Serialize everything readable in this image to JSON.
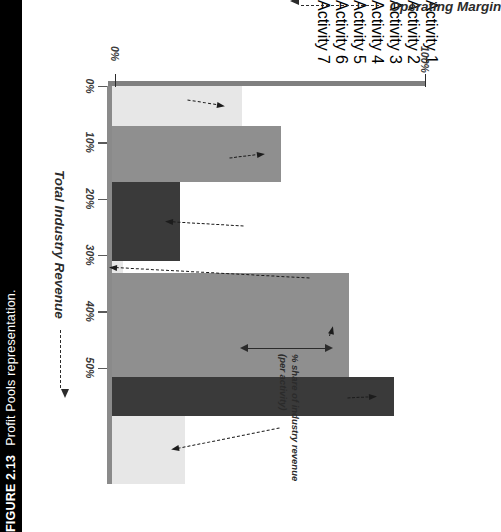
{
  "figure": {
    "number": "FIGURE 2.13",
    "caption": "Profit Pools representation."
  },
  "chart_data": {
    "type": "bar",
    "title": "Profit Pools representation.",
    "xlabel": "Total Industry Revenue",
    "ylabel": "Operating Margin",
    "xlim": [
      0,
      100
    ],
    "ylim": [
      0,
      55
    ],
    "grid": false,
    "orientation": "marimekko-profit-pool",
    "xtick_labels": [
      "0%",
      "100%"
    ],
    "ytick_labels": [
      "0%",
      "10%",
      "20%",
      "30%",
      "40%",
      "50%"
    ],
    "ytick_values": [
      0,
      10,
      20,
      30,
      40,
      50
    ],
    "categories": [
      "Activity 1",
      "Activity 2",
      "Activity 3",
      "Activity 4",
      "Activity 5",
      "Activity 6",
      "Activity 7"
    ],
    "series": [
      {
        "name": "Operating Margin",
        "values": [
          23,
          30,
          12,
          2,
          42,
          50,
          13
        ]
      },
      {
        "name": "% share of industry revenue",
        "values": [
          10,
          14,
          20,
          3,
          26,
          10,
          17
        ]
      }
    ],
    "segments": [
      {
        "label": "Activity 1",
        "margin": 23,
        "revenue_share": 10,
        "revenue_start": 0,
        "revenue_end": 10,
        "fill": "#e7e7e7"
      },
      {
        "label": "Activity 2",
        "margin": 30,
        "revenue_share": 14,
        "revenue_start": 10,
        "revenue_end": 24,
        "fill": "#8f8f8f"
      },
      {
        "label": "Activity 3",
        "margin": 12,
        "revenue_share": 20,
        "revenue_start": 24,
        "revenue_end": 44,
        "fill": "#3a3a3a"
      },
      {
        "label": "Activity 4",
        "margin": 2,
        "revenue_share": 3,
        "revenue_start": 44,
        "revenue_end": 47,
        "fill": "#e7e7e7"
      },
      {
        "label": "Activity 5",
        "margin": 42,
        "revenue_share": 26,
        "revenue_start": 47,
        "revenue_end": 73,
        "fill": "#8f8f8f"
      },
      {
        "label": "Activity 6",
        "margin": 50,
        "revenue_share": 10,
        "revenue_start": 73,
        "revenue_end": 83,
        "fill": "#3a3a3a"
      },
      {
        "label": "Activity 7",
        "margin": 13,
        "revenue_share": 17,
        "revenue_start": 83,
        "revenue_end": 100,
        "fill": "#e7e7e7"
      }
    ],
    "annotations": [
      {
        "name": "Activity 1",
        "text": "Activity 1"
      },
      {
        "name": "Activity 2",
        "text": "Activity 2"
      },
      {
        "name": "Activity 3",
        "text": "Activity 3"
      },
      {
        "name": "Activity 4",
        "text": "Activity 4"
      },
      {
        "name": "Activity 5",
        "text": "Activity 5"
      },
      {
        "name": "Activity 6",
        "text": "Activity 6"
      },
      {
        "name": "Activity 7",
        "text": "Activity 7"
      },
      {
        "name": "revenue-bracket",
        "line1": "% share of industry revenue",
        "line2": "(per activity)"
      }
    ],
    "colors": {
      "light": "#e7e7e7",
      "medium": "#8f8f8f",
      "dark": "#3a3a3a",
      "axis": "#8a8a8a",
      "text": "#1c1c1c",
      "caption_bg": "#000000",
      "caption_fg": "#ffffff"
    }
  },
  "axes": {
    "x_zero_label": "0%",
    "x_full_label": "100%",
    "x_title": "Total Industry Revenue",
    "y_title": "Operating Margin",
    "y_ticks": [
      "0%",
      "10%",
      "20%",
      "30%",
      "40%",
      "50%"
    ]
  },
  "bracket": {
    "line1": "% share of industry revenue",
    "line2": "(per activity)"
  },
  "labels": {
    "activity1": "Activity 1",
    "activity2": "Activity 2",
    "activity3": "Activity 3",
    "activity4": "Activity 4",
    "activity5": "Activity 5",
    "activity6": "Activity 6",
    "activity7": "Activity 7"
  }
}
